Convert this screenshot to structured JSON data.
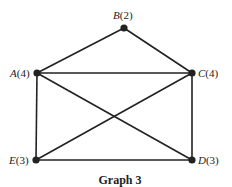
{
  "caption": "Graph 3",
  "nodes": [
    {
      "id": "A",
      "degree": "4",
      "x": 37,
      "y": 73
    },
    {
      "id": "B",
      "degree": "2",
      "x": 124,
      "y": 28
    },
    {
      "id": "C",
      "degree": "4",
      "x": 192,
      "y": 73
    },
    {
      "id": "D",
      "degree": "3",
      "x": 192,
      "y": 160
    },
    {
      "id": "E",
      "degree": "3",
      "x": 36,
      "y": 160
    }
  ],
  "edges": [
    [
      "A",
      "B"
    ],
    [
      "B",
      "C"
    ],
    [
      "A",
      "C"
    ],
    [
      "A",
      "E"
    ],
    [
      "A",
      "D"
    ],
    [
      "C",
      "E"
    ],
    [
      "C",
      "D"
    ],
    [
      "E",
      "D"
    ]
  ],
  "labels": {
    "A": {
      "name": "A",
      "paren": "(4)"
    },
    "B": {
      "name": "B",
      "paren": "(2)"
    },
    "C": {
      "name": "C",
      "paren": "(4)"
    },
    "D": {
      "name": "D",
      "paren": "(3)"
    },
    "E": {
      "name": "E",
      "paren": "(3)"
    }
  }
}
